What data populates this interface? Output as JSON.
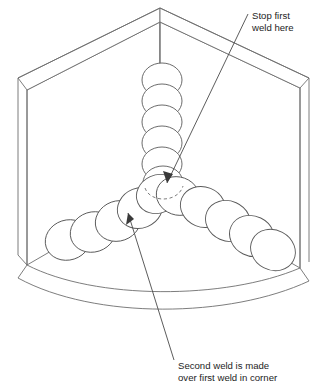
{
  "diagram": {
    "background_color": "#ffffff",
    "line_color": "#6e6e6e",
    "text_color": "#1d1d1d",
    "annotations": [
      {
        "id": "stop-first-weld",
        "line1": "Stop first",
        "line2": "weld here",
        "text_x": 252,
        "text_y": 19,
        "leader_from": [
          248,
          14
        ],
        "leader_to": [
          167,
          182
        ]
      },
      {
        "id": "second-weld",
        "line1": "Second weld is made",
        "line2": "over first weld in corner",
        "text_x": 178,
        "text_y": 369,
        "leader_from": [
          174,
          360
        ],
        "leader_to": [
          128,
          212
        ]
      }
    ],
    "structure": {
      "apex": [
        160,
        8
      ],
      "left_panel_outer": [
        18,
        93
      ],
      "right_panel_outer": [
        305,
        93
      ],
      "left_panel_inner": [
        27,
        90
      ],
      "right_panel_inner": [
        300,
        88
      ],
      "panel_bottom_left": [
        27,
        265
      ],
      "panel_bottom_right": [
        300,
        268
      ],
      "corner_vertical_top": [
        160,
        22
      ],
      "corner_vertical_bottom": [
        160,
        185
      ],
      "floor_arc_outer_label": "outer floor edge",
      "floor_arc_inner_label": "inner floor edge"
    },
    "weld_beads": {
      "vertical_bead_label": "first weld vertical corner bead",
      "vertical_count": 6,
      "left_bead_label": "second weld left fillet bead",
      "left_count": 5,
      "right_bead_label": "second weld right fillet bead",
      "right_count": 5,
      "junction": [
        163,
        190
      ],
      "hidden_arc_label": "hidden weld contour at corner"
    }
  }
}
